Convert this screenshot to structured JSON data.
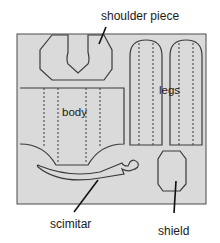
{
  "diagram": {
    "title": "",
    "board_color": "#dadada",
    "outline_color": "#3a3a3a",
    "background": "#ffffff",
    "parts": [
      {
        "id": "shoulder-piece",
        "label": "shoulder piece",
        "label_position": "outside-top"
      },
      {
        "id": "legs",
        "label": "legs",
        "label_position": "inside",
        "count": 2
      },
      {
        "id": "body",
        "label": "body",
        "label_position": "inside"
      },
      {
        "id": "scimitar",
        "label": "scimitar",
        "label_position": "outside-bottom"
      },
      {
        "id": "shield",
        "label": "shield",
        "label_position": "outside-bottom"
      }
    ]
  },
  "labels": {
    "shoulder_piece": "shoulder piece",
    "legs": "legs",
    "body": "body",
    "scimitar": "scimitar",
    "shield": "shield"
  }
}
